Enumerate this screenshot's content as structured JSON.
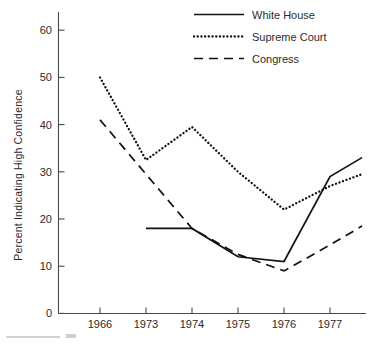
{
  "chart_data": {
    "type": "line",
    "title": "",
    "subtitle": "",
    "xlabel": "",
    "ylabel": "Percent Indicating High Confidence",
    "categories": [
      "1966",
      "1973",
      "1974",
      "1975",
      "1976",
      "1977"
    ],
    "x_tick_labels": [
      "1966",
      "1973",
      "1974",
      "1975",
      "1976",
      "1977"
    ],
    "y_tick_labels": [
      "0",
      "10",
      "20",
      "30",
      "40",
      "50",
      "60"
    ],
    "y_ticks": [
      0,
      10,
      20,
      30,
      40,
      50,
      60
    ],
    "ylim": [
      0,
      63
    ],
    "xlim_note": "categories equally spaced; lines extend slightly beyond the 1977 tick to the plot edge",
    "grid": false,
    "legend_position": "top-right",
    "line_color": "#111111",
    "axis_color": "#4a4a4a",
    "background_color": "#ffffff",
    "series": [
      {
        "name": "White House",
        "style": "solid",
        "x": [
          "1973",
          "1974",
          "1975",
          "1976",
          "1977",
          "end"
        ],
        "values": [
          18,
          18,
          12,
          11,
          29,
          33
        ]
      },
      {
        "name": "Supreme Court",
        "style": "dotted",
        "x": [
          "1966",
          "1973",
          "1974",
          "1975",
          "1976",
          "1977",
          "end"
        ],
        "values": [
          50,
          32.5,
          39.5,
          30,
          22,
          27,
          29.5
        ]
      },
      {
        "name": "Congress",
        "style": "dashed",
        "x": [
          "1966",
          "1974",
          "1975",
          "1976",
          "1977",
          "end"
        ],
        "values": [
          41,
          18,
          12.5,
          9,
          14.5,
          18.5
        ]
      }
    ]
  },
  "legend": {
    "items": [
      {
        "label": "White House",
        "style": "solid"
      },
      {
        "label": "Supreme Court",
        "style": "dotted"
      },
      {
        "label": "Congress",
        "style": "dashed"
      }
    ]
  },
  "axes": {
    "y_title": "Percent Indicating High Confidence",
    "y_labels": [
      "60",
      "50",
      "40",
      "30",
      "20",
      "10",
      "0"
    ],
    "x_labels": [
      "1966",
      "1973",
      "1974",
      "1975",
      "1976",
      "1977"
    ]
  }
}
